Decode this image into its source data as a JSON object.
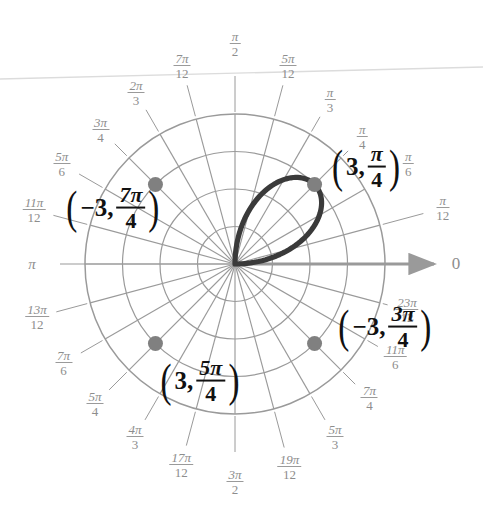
{
  "figure": {
    "type": "polar-plot",
    "background": "#ffffff",
    "grid_color": "#9a9a9a",
    "curve_color": "#3a3a3a",
    "point_color": "#808080",
    "label_color": "#8d8d8d",
    "annotation_color": "#111111"
  },
  "axis": {
    "origin_label": "0",
    "pi_label": "π",
    "arrow_direction": "right"
  },
  "ticks": [
    {
      "id": "pi-over-12",
      "num": "π",
      "den": "12",
      "angle_deg": 15,
      "value": "π/12"
    },
    {
      "id": "pi-over-6",
      "num": "π",
      "den": "6",
      "angle_deg": 30,
      "value": "π/6"
    },
    {
      "id": "pi-over-4",
      "num": "π",
      "den": "4",
      "angle_deg": 45,
      "value": "π/4"
    },
    {
      "id": "pi-over-3",
      "num": "π",
      "den": "3",
      "angle_deg": 60,
      "value": "π/3"
    },
    {
      "id": "5pi-over-12",
      "num": "5π",
      "den": "12",
      "angle_deg": 75,
      "value": "5π/12"
    },
    {
      "id": "pi-over-2",
      "num": "π",
      "den": "2",
      "angle_deg": 90,
      "value": "π/2"
    },
    {
      "id": "7pi-over-12",
      "num": "7π",
      "den": "12",
      "angle_deg": 105,
      "value": "7π/12"
    },
    {
      "id": "2pi-over-3",
      "num": "2π",
      "den": "3",
      "angle_deg": 120,
      "value": "2π/3"
    },
    {
      "id": "3pi-over-4",
      "num": "3π",
      "den": "4",
      "angle_deg": 135,
      "value": "3π/4"
    },
    {
      "id": "5pi-over-6",
      "num": "5π",
      "den": "6",
      "angle_deg": 150,
      "value": "5π/6"
    },
    {
      "id": "11pi-over-12",
      "num": "11π",
      "den": "12",
      "angle_deg": 165,
      "value": "11π/12"
    },
    {
      "id": "13pi-over-12",
      "num": "13π",
      "den": "12",
      "angle_deg": 195,
      "value": "13π/12"
    },
    {
      "id": "7pi-over-6",
      "num": "7π",
      "den": "6",
      "angle_deg": 210,
      "value": "7π/6"
    },
    {
      "id": "5pi-over-4",
      "num": "5π",
      "den": "4",
      "angle_deg": 225,
      "value": "5π/4"
    },
    {
      "id": "4pi-over-3",
      "num": "4π",
      "den": "3",
      "angle_deg": 240,
      "value": "4π/3"
    },
    {
      "id": "17pi-over-12",
      "num": "17π",
      "den": "12",
      "angle_deg": 255,
      "value": "17π/12"
    },
    {
      "id": "3pi-over-2",
      "num": "3π",
      "den": "2",
      "angle_deg": 270,
      "value": "3π/2"
    },
    {
      "id": "19pi-over-12",
      "num": "19π",
      "den": "12",
      "angle_deg": 285,
      "value": "19π/12"
    },
    {
      "id": "5pi-over-3",
      "num": "5π",
      "den": "3",
      "angle_deg": 300,
      "value": "5π/3"
    },
    {
      "id": "7pi-over-4",
      "num": "7π",
      "den": "4",
      "angle_deg": 315,
      "value": "7π/4"
    },
    {
      "id": "11pi-over-6",
      "num": "11π",
      "den": "6",
      "angle_deg": 330,
      "value": "11π/6"
    },
    {
      "id": "23pi-over-12",
      "num": "23π",
      "den": "12",
      "angle_deg": 345,
      "value": "23π/12"
    }
  ],
  "annotations": [
    {
      "id": "point-3-pi-over-4",
      "lead": "3,",
      "num": "π",
      "den": "4",
      "text": "(3, π/4)",
      "x": 366,
      "y": 167
    },
    {
      "id": "point-neg3-7pi-over-4",
      "lead": "−3,",
      "num": "7π",
      "den": "4",
      "text": "(−3, 7π/4)",
      "x": 113,
      "y": 208
    },
    {
      "id": "point-3-5pi-over-4",
      "lead": "3,",
      "num": "5π",
      "den": "4",
      "text": "(3, 5π/4)",
      "x": 200,
      "y": 381
    },
    {
      "id": "point-neg3-3pi-over-4",
      "lead": "−3,",
      "num": "3π",
      "den": "4",
      "text": "(−3, 3π/4)",
      "x": 385,
      "y": 327
    }
  ],
  "chart_data": {
    "type": "line",
    "coordinate_system": "polar",
    "xlabel": "",
    "ylabel": "",
    "rmax": 4,
    "r_rings": [
      1,
      2,
      3,
      4
    ],
    "theta_step_deg": 15,
    "grid": true,
    "legend": "none",
    "series": [
      {
        "name": "petal",
        "equation": "r = 3 sin(2θ)",
        "theta_range_deg": [
          0,
          90
        ],
        "rmax_value": 3,
        "peak_theta_deg": 45
      }
    ],
    "points": [
      {
        "label": "(3, π/4)",
        "r": 3,
        "theta_deg": 45,
        "marked": true
      },
      {
        "label": "(−3, 7π/4)",
        "r": -3,
        "theta_deg": 315,
        "marked": true
      },
      {
        "label": "(3, 5π/4)",
        "r": 3,
        "theta_deg": 225,
        "marked": true
      },
      {
        "label": "(−3, 3π/4)",
        "r": -3,
        "theta_deg": 135,
        "marked": true
      }
    ],
    "angle_tick_labels": [
      "0",
      "π/12",
      "π/6",
      "π/4",
      "π/3",
      "5π/12",
      "π/2",
      "7π/12",
      "2π/3",
      "3π/4",
      "5π/6",
      "11π/12",
      "π",
      "13π/12",
      "7π/6",
      "5π/4",
      "4π/3",
      "17π/12",
      "3π/2",
      "19π/12",
      "5π/3",
      "7π/4",
      "11π/6",
      "23π/12"
    ]
  }
}
